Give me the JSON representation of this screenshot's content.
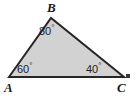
{
  "figure": {
    "type": "triangle-angle-diagram",
    "width": 136,
    "height": 97,
    "background_color": "#ffffff",
    "fill_color": "#d2d2d2",
    "stroke_color": "#262626",
    "stroke_width": 2
  },
  "vertices": [
    {
      "name": "A",
      "label": "A",
      "x": 9,
      "y": 77
    },
    {
      "name": "B",
      "label": "B",
      "x": 51,
      "y": 18
    },
    {
      "name": "C",
      "label": "C",
      "x": 124,
      "y": 77
    }
  ],
  "angles": [
    {
      "at": "A",
      "value": "60",
      "degree_symbol": "°"
    },
    {
      "at": "B",
      "value": "80",
      "degree_symbol": "°"
    },
    {
      "at": "C",
      "value": "40",
      "degree_symbol": "°"
    }
  ],
  "chart_data": {
    "type": "diagram",
    "title": "",
    "categories": [
      "A",
      "B",
      "C"
    ],
    "values": [
      60,
      80,
      40
    ],
    "xlabel": "",
    "ylabel": "",
    "annotations": [
      "60°",
      "80°",
      "40°"
    ],
    "legend": []
  }
}
